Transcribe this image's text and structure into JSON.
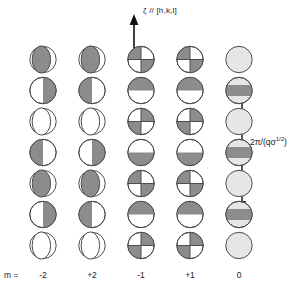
{
  "figure": {
    "width": 297,
    "height": 291,
    "background": "#ffffff"
  },
  "axis": {
    "name": "zeta-axis-arrow",
    "label": "ζ // [h,k,l]",
    "direction": "up"
  },
  "scale_bar": {
    "name": "period-scale-bar",
    "label_prefix": "2π/(qσ",
    "label_exponent": "1/2",
    "label_suffix": ")",
    "label_full": "2π/(qσ^(1/2))",
    "direction": "double-headed-vertical"
  },
  "legend": {
    "row_prefix_label": "m ="
  },
  "colors": {
    "fill_gray": "#8c8c8c",
    "fill_light": "#e6e6e6",
    "stroke": "#4d4d4d",
    "white": "#ffffff",
    "text": "#1a1a1a"
  },
  "columns": [
    {
      "m_label": "-2",
      "name": "column-m-minus-2",
      "x": 26,
      "cells": [
        {
          "shape": "lens-vertical",
          "fill": "gray"
        },
        {
          "shape": "half",
          "fill": "right"
        },
        {
          "shape": "lens-vertical",
          "fill": "white"
        },
        {
          "shape": "half",
          "fill": "left"
        },
        {
          "shape": "lens-vertical",
          "fill": "gray"
        },
        {
          "shape": "half",
          "fill": "right"
        },
        {
          "shape": "lens-vertical",
          "fill": "white"
        }
      ]
    },
    {
      "m_label": "+2",
      "name": "column-m-plus-2",
      "x": 75,
      "cells": [
        {
          "shape": "lens-vertical",
          "fill": "gray"
        },
        {
          "shape": "half",
          "fill": "left"
        },
        {
          "shape": "lens-vertical",
          "fill": "white"
        },
        {
          "shape": "half",
          "fill": "right"
        },
        {
          "shape": "lens-vertical",
          "fill": "gray"
        },
        {
          "shape": "half",
          "fill": "left"
        },
        {
          "shape": "lens-vertical",
          "fill": "white"
        }
      ]
    },
    {
      "m_label": "-1",
      "name": "column-m-minus-1",
      "x": 124,
      "cells": [
        {
          "shape": "quadrant",
          "fill": "tl-br"
        },
        {
          "shape": "half-horizontal",
          "fill": "top"
        },
        {
          "shape": "quadrant",
          "fill": "tr-bl"
        },
        {
          "shape": "half-horizontal",
          "fill": "bottom"
        },
        {
          "shape": "quadrant",
          "fill": "tl-br"
        },
        {
          "shape": "half-horizontal",
          "fill": "top"
        },
        {
          "shape": "quadrant",
          "fill": "tr-bl"
        }
      ]
    },
    {
      "m_label": "+1",
      "name": "column-m-plus-1",
      "x": 173,
      "cells": [
        {
          "shape": "quadrant",
          "fill": "tl-br"
        },
        {
          "shape": "half-horizontal",
          "fill": "top"
        },
        {
          "shape": "quadrant",
          "fill": "tr-bl"
        },
        {
          "shape": "half-horizontal",
          "fill": "bottom"
        },
        {
          "shape": "quadrant",
          "fill": "tl-br"
        },
        {
          "shape": "half-horizontal",
          "fill": "top"
        },
        {
          "shape": "quadrant",
          "fill": "tr-bl"
        }
      ]
    },
    {
      "m_label": "0",
      "name": "column-m-zero",
      "x": 222,
      "cells": [
        {
          "shape": "plain",
          "fill": "light"
        },
        {
          "shape": "band",
          "fill": "gray"
        },
        {
          "shape": "plain",
          "fill": "light"
        },
        {
          "shape": "band",
          "fill": "gray"
        },
        {
          "shape": "plain",
          "fill": "light"
        },
        {
          "shape": "band",
          "fill": "gray"
        },
        {
          "shape": "plain",
          "fill": "light"
        }
      ]
    }
  ]
}
